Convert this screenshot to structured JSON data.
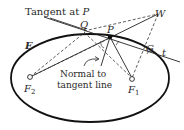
{
  "diagram": {
    "labels": {
      "tangent_at": "Tangent at ",
      "tangent_point": "P",
      "ellipse": "E",
      "point_p": "P",
      "point_q": "Q",
      "point_w": "W",
      "point_g": "G",
      "line_t": "t",
      "focus_1": "F",
      "focus_1_sub": "1",
      "focus_2": "F",
      "focus_2_sub": "2",
      "normal_line1": "Normal to",
      "normal_line2": "tangent line"
    },
    "colors": {
      "stroke": "#1a1a1a",
      "dashed": "#3a3a3a",
      "background": "#ffffff"
    }
  }
}
